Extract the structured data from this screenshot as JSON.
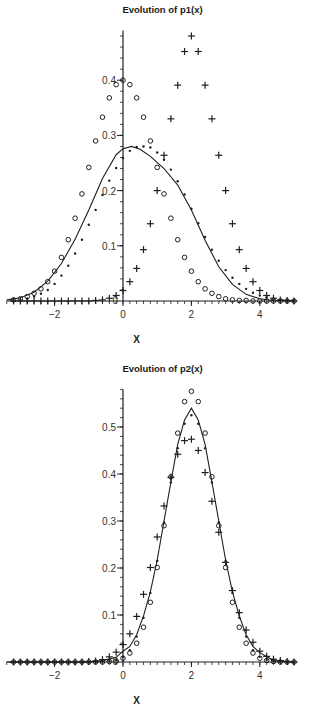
{
  "chart_data": [
    {
      "type": "scatter",
      "title": "Evolution of p1(x)",
      "xlabel": "X",
      "ylabel": "",
      "xlim": [
        -3.4,
        5.0
      ],
      "ylim": [
        0,
        0.49
      ],
      "x_ticks": [
        -2,
        0,
        2,
        4
      ],
      "y_ticks": [
        0.1,
        0.2,
        0.3,
        0.4
      ],
      "grid": false,
      "legend": null,
      "series": [
        {
          "name": "circles",
          "marker": "circle",
          "shape": "gaussian",
          "mean": 0.0,
          "sd": 1.0,
          "peak": 0.4,
          "x": [
            -3.2,
            -3.0,
            -2.8,
            -2.6,
            -2.4,
            -2.2,
            -2.0,
            -1.8,
            -1.6,
            -1.4,
            -1.2,
            -1.0,
            -0.8,
            -0.6,
            -0.4,
            -0.2,
            0.0,
            0.2,
            0.4,
            0.6,
            0.8,
            1.0,
            1.2,
            1.4,
            1.6,
            1.8,
            2.0,
            2.2,
            2.4,
            2.6,
            2.8,
            3.0,
            3.2,
            3.4,
            3.6,
            3.8,
            4.0,
            4.2,
            4.4,
            4.6,
            4.8,
            5.0
          ],
          "y": [
            0.002,
            0.004,
            0.008,
            0.014,
            0.022,
            0.035,
            0.054,
            0.079,
            0.111,
            0.15,
            0.194,
            0.242,
            0.29,
            0.333,
            0.368,
            0.392,
            0.4,
            0.392,
            0.368,
            0.333,
            0.29,
            0.242,
            0.194,
            0.15,
            0.111,
            0.079,
            0.054,
            0.035,
            0.022,
            0.014,
            0.008,
            0.004,
            0.002,
            0.001,
            0.001,
            0.0,
            0.0,
            0.0,
            0.0,
            0.0,
            0.0,
            0.0
          ]
        },
        {
          "name": "plus",
          "marker": "plus",
          "shape": "gaussian",
          "mean": 2.0,
          "sd": 0.83,
          "peak": 0.48,
          "x": [
            -3.2,
            -3.0,
            -2.8,
            -2.6,
            -2.4,
            -2.2,
            -2.0,
            -1.8,
            -1.6,
            -1.4,
            -1.2,
            -1.0,
            -0.8,
            -0.6,
            -0.4,
            -0.2,
            0.0,
            0.2,
            0.4,
            0.6,
            0.8,
            1.0,
            1.2,
            1.4,
            1.6,
            1.8,
            2.0,
            2.2,
            2.4,
            2.6,
            2.8,
            3.0,
            3.2,
            3.4,
            3.6,
            3.8,
            4.0,
            4.2,
            4.4,
            4.6,
            4.8,
            5.0
          ],
          "y": [
            0.0,
            0.0,
            0.0,
            0.0,
            0.0,
            0.0,
            0.0,
            0.0,
            0.0,
            0.0,
            0.0,
            0.0,
            0.001,
            0.002,
            0.005,
            0.01,
            0.019,
            0.035,
            0.059,
            0.093,
            0.14,
            0.2,
            0.264,
            0.33,
            0.391,
            0.452,
            0.48,
            0.452,
            0.391,
            0.33,
            0.264,
            0.2,
            0.14,
            0.093,
            0.059,
            0.035,
            0.019,
            0.01,
            0.005,
            0.002,
            0.001,
            0.0
          ]
        },
        {
          "name": "dots",
          "marker": "dot",
          "shape": "gaussian",
          "mean": 1.5,
          "sd": 1.4,
          "peak": 0.28,
          "x": [
            -3.2,
            -3.0,
            -2.8,
            -2.6,
            -2.4,
            -2.2,
            -2.0,
            -1.8,
            -1.6,
            -1.4,
            -1.2,
            -1.0,
            -0.8,
            -0.6,
            -0.4,
            -0.2,
            0.0,
            0.2,
            0.4,
            0.6,
            0.8,
            1.0,
            1.2,
            1.4,
            1.6,
            1.8,
            2.0,
            2.2,
            2.4,
            2.6,
            2.8,
            3.0,
            3.2,
            3.4,
            3.6,
            3.8,
            4.0,
            4.2,
            4.4,
            4.6,
            4.8,
            5.0
          ],
          "y": [
            0.001,
            0.002,
            0.004,
            0.008,
            0.013,
            0.02,
            0.031,
            0.046,
            0.064,
            0.086,
            0.111,
            0.138,
            0.165,
            0.192,
            0.218,
            0.241,
            0.259,
            0.272,
            0.279,
            0.28,
            0.278,
            0.269,
            0.256,
            0.238,
            0.217,
            0.193,
            0.167,
            0.141,
            0.116,
            0.093,
            0.073,
            0.056,
            0.042,
            0.031,
            0.022,
            0.015,
            0.01,
            0.007,
            0.004,
            0.002,
            0.001,
            0.001
          ]
        },
        {
          "name": "solid line",
          "marker": "line",
          "shape": "curve",
          "x": [
            -3.4,
            -3.0,
            -2.6,
            -2.2,
            -1.8,
            -1.4,
            -1.0,
            -0.6,
            -0.2,
            0.0,
            0.25,
            0.5,
            0.8,
            1.2,
            1.6,
            2.0,
            2.4,
            2.8,
            3.2,
            3.6,
            4.0,
            4.4,
            5.0
          ],
          "y": [
            0.002,
            0.006,
            0.016,
            0.036,
            0.068,
            0.112,
            0.165,
            0.222,
            0.265,
            0.276,
            0.28,
            0.275,
            0.262,
            0.24,
            0.21,
            0.165,
            0.11,
            0.062,
            0.03,
            0.012,
            0.004,
            0.001,
            0.0
          ]
        }
      ]
    },
    {
      "type": "scatter",
      "title": "Evolution of p2(x)",
      "xlabel": "X",
      "ylabel": "",
      "xlim": [
        -3.4,
        5.0
      ],
      "ylim": [
        0,
        0.58
      ],
      "x_ticks": [
        -2,
        0,
        2,
        4
      ],
      "y_ticks": [
        0.1,
        0.2,
        0.3,
        0.4,
        0.5
      ],
      "grid": false,
      "legend": null,
      "series": [
        {
          "name": "circles",
          "marker": "circle",
          "shape": "gaussian",
          "mean": 2.0,
          "sd": 0.69,
          "peak": 0.576,
          "x": [
            -3.2,
            -3.0,
            -2.8,
            -2.6,
            -2.4,
            -2.2,
            -2.0,
            -1.8,
            -1.6,
            -1.4,
            -1.2,
            -1.0,
            -0.8,
            -0.6,
            -0.4,
            -0.2,
            0.0,
            0.2,
            0.4,
            0.6,
            0.8,
            1.0,
            1.2,
            1.4,
            1.6,
            1.8,
            2.0,
            2.2,
            2.4,
            2.6,
            2.8,
            3.0,
            3.2,
            3.4,
            3.6,
            3.8,
            4.0,
            4.2,
            4.4,
            4.6,
            4.8,
            5.0
          ],
          "y": [
            0.0,
            0.0,
            0.0,
            0.0,
            0.0,
            0.0,
            0.0,
            0.0,
            0.0,
            0.0,
            0.0,
            0.0,
            0.0,
            0.0,
            0.001,
            0.002,
            0.008,
            0.019,
            0.04,
            0.074,
            0.127,
            0.201,
            0.29,
            0.394,
            0.487,
            0.554,
            0.576,
            0.554,
            0.487,
            0.394,
            0.29,
            0.201,
            0.127,
            0.074,
            0.04,
            0.019,
            0.008,
            0.003,
            0.001,
            0.0,
            0.0,
            0.0
          ]
        },
        {
          "name": "dots",
          "marker": "dot",
          "shape": "gaussian",
          "mean": 2.0,
          "sd": 0.75,
          "peak": 0.525,
          "x": [
            -3.2,
            -3.0,
            -2.8,
            -2.6,
            -2.4,
            -2.2,
            -2.0,
            -1.8,
            -1.6,
            -1.4,
            -1.2,
            -1.0,
            -0.8,
            -0.6,
            -0.4,
            -0.2,
            0.0,
            0.2,
            0.4,
            0.6,
            0.8,
            1.0,
            1.2,
            1.4,
            1.6,
            1.8,
            2.0,
            2.2,
            2.4,
            2.6,
            2.8,
            3.0,
            3.2,
            3.4,
            3.6,
            3.8,
            4.0,
            4.2,
            4.4,
            4.6,
            4.8,
            5.0
          ],
          "y": [
            0.0,
            0.0,
            0.0,
            0.0,
            0.0,
            0.0,
            0.0,
            0.0,
            0.0,
            0.0,
            0.0,
            0.0,
            0.0,
            0.001,
            0.002,
            0.004,
            0.011,
            0.025,
            0.054,
            0.094,
            0.147,
            0.215,
            0.297,
            0.382,
            0.455,
            0.507,
            0.525,
            0.507,
            0.455,
            0.382,
            0.297,
            0.215,
            0.147,
            0.094,
            0.054,
            0.025,
            0.011,
            0.004,
            0.002,
            0.001,
            0.0,
            0.0
          ]
        },
        {
          "name": "plus",
          "marker": "plus",
          "shape": "gaussian",
          "mean": 1.9,
          "sd": 0.84,
          "peak": 0.477,
          "x": [
            -3.2,
            -3.0,
            -2.8,
            -2.6,
            -2.4,
            -2.2,
            -2.0,
            -1.8,
            -1.6,
            -1.4,
            -1.2,
            -1.0,
            -0.8,
            -0.6,
            -0.4,
            -0.2,
            0.0,
            0.2,
            0.4,
            0.6,
            0.8,
            1.0,
            1.2,
            1.4,
            1.6,
            1.8,
            2.0,
            2.2,
            2.4,
            2.6,
            2.8,
            3.0,
            3.2,
            3.4,
            3.6,
            3.8,
            4.0,
            4.2,
            4.4,
            4.6,
            4.8,
            5.0
          ],
          "y": [
            0.0,
            0.0,
            0.0,
            0.0,
            0.0,
            0.0,
            0.0,
            0.0,
            0.0,
            0.0,
            0.0,
            0.001,
            0.002,
            0.005,
            0.011,
            0.021,
            0.037,
            0.06,
            0.097,
            0.144,
            0.201,
            0.266,
            0.332,
            0.393,
            0.442,
            0.471,
            0.474,
            0.45,
            0.403,
            0.342,
            0.276,
            0.212,
            0.152,
            0.105,
            0.068,
            0.042,
            0.023,
            0.012,
            0.006,
            0.003,
            0.001,
            0.0
          ]
        },
        {
          "name": "solid line",
          "marker": "line",
          "shape": "gaussian",
          "mean": 2.0,
          "sd": 0.74,
          "peak": 0.54,
          "x": [
            -3.4,
            -2.6,
            -1.8,
            -1.0,
            -0.6,
            -0.2,
            0.0,
            0.2,
            0.4,
            0.6,
            0.8,
            1.0,
            1.2,
            1.4,
            1.6,
            1.8,
            2.0,
            2.2,
            2.4,
            2.6,
            2.8,
            3.0,
            3.2,
            3.4,
            3.6,
            3.8,
            4.0,
            4.4,
            5.0
          ],
          "y": [
            0.0,
            0.0,
            0.0,
            0.0,
            0.003,
            0.01,
            0.023,
            0.033,
            0.058,
            0.098,
            0.149,
            0.217,
            0.3,
            0.383,
            0.463,
            0.515,
            0.54,
            0.515,
            0.463,
            0.383,
            0.3,
            0.217,
            0.149,
            0.098,
            0.058,
            0.033,
            0.02,
            0.003,
            0.0
          ]
        }
      ]
    }
  ],
  "charts": {
    "top": {
      "title": "Evolution of p1(x)",
      "xlabel": "X",
      "xtick_labels": [
        "-2",
        "0",
        "2",
        "4"
      ],
      "ytick_labels": [
        "0.1",
        "0.2",
        "0.3",
        "0.4"
      ],
      "origin_label": "0"
    },
    "bottom": {
      "title": "Evolution of p2(x)",
      "xlabel": "X",
      "xtick_labels": [
        "-2",
        "0",
        "2",
        "4"
      ],
      "ytick_labels": [
        "0.1",
        "0.2",
        "0.3",
        "0.4",
        "0.5"
      ],
      "origin_label": "0"
    }
  },
  "colors": {
    "ink": "#1e1e1e",
    "background": "#ffffff"
  }
}
